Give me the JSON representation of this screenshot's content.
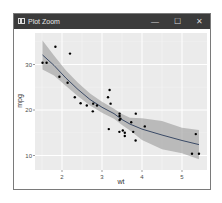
{
  "window": {
    "title": "Plot Zoom",
    "controls": {
      "minimize": "—",
      "maximize": "☐",
      "close": "✕"
    }
  },
  "colors": {
    "titlebar": "#3b3b3b",
    "panel": "#ebebeb",
    "grid": "#ffffff",
    "band": "#999999",
    "line": "#3a4a66",
    "point": "#000000"
  },
  "chart_data": {
    "type": "scatter",
    "title": "",
    "xlabel": "wt",
    "ylabel": "mpg",
    "xlim": [
      1.4,
      5.5
    ],
    "ylim": [
      9.5,
      35.5
    ],
    "x_ticks": [
      2,
      3,
      4,
      5
    ],
    "y_ticks": [
      10,
      20,
      30
    ],
    "grid": true,
    "smooth": "loess with confidence band",
    "points": [
      [
        2.62,
        21.0
      ],
      [
        2.875,
        21.0
      ],
      [
        2.32,
        22.8
      ],
      [
        3.215,
        21.4
      ],
      [
        3.44,
        18.7
      ],
      [
        3.46,
        18.1
      ],
      [
        3.57,
        14.3
      ],
      [
        3.19,
        24.4
      ],
      [
        3.15,
        22.8
      ],
      [
        3.44,
        19.2
      ],
      [
        3.44,
        17.8
      ],
      [
        4.07,
        16.4
      ],
      [
        3.73,
        17.3
      ],
      [
        3.78,
        15.2
      ],
      [
        5.25,
        10.4
      ],
      [
        5.424,
        10.4
      ],
      [
        5.345,
        14.7
      ],
      [
        2.2,
        32.4
      ],
      [
        1.615,
        30.4
      ],
      [
        1.835,
        33.9
      ],
      [
        2.465,
        21.5
      ],
      [
        3.52,
        15.5
      ],
      [
        3.435,
        15.2
      ],
      [
        3.84,
        13.3
      ],
      [
        3.845,
        19.2
      ],
      [
        1.935,
        27.3
      ],
      [
        2.14,
        26.0
      ],
      [
        1.513,
        30.4
      ],
      [
        3.17,
        15.8
      ],
      [
        2.77,
        19.7
      ],
      [
        3.57,
        15.0
      ],
      [
        2.78,
        21.4
      ]
    ],
    "smooth_line": [
      [
        1.513,
        32.1
      ],
      [
        1.8,
        29.8
      ],
      [
        2.1,
        27.0
      ],
      [
        2.4,
        24.5
      ],
      [
        2.7,
        22.3
      ],
      [
        3.0,
        20.6
      ],
      [
        3.3,
        19.2
      ],
      [
        3.5,
        17.9
      ],
      [
        3.7,
        16.9
      ],
      [
        4.0,
        15.8
      ],
      [
        4.5,
        14.5
      ],
      [
        5.0,
        13.3
      ],
      [
        5.424,
        12.4
      ]
    ],
    "band_upper": [
      [
        1.513,
        35.3
      ],
      [
        1.8,
        32.0
      ],
      [
        2.1,
        28.7
      ],
      [
        2.4,
        26.0
      ],
      [
        2.7,
        23.6
      ],
      [
        3.0,
        21.8
      ],
      [
        3.3,
        20.3
      ],
      [
        3.5,
        19.1
      ],
      [
        3.7,
        18.3
      ],
      [
        4.0,
        18.2
      ],
      [
        4.5,
        17.6
      ],
      [
        5.0,
        16.1
      ],
      [
        5.424,
        15.6
      ]
    ],
    "band_lower": [
      [
        1.513,
        28.9
      ],
      [
        1.8,
        27.6
      ],
      [
        2.1,
        25.3
      ],
      [
        2.4,
        23.0
      ],
      [
        2.7,
        21.0
      ],
      [
        3.0,
        19.4
      ],
      [
        3.3,
        18.1
      ],
      [
        3.5,
        16.7
      ],
      [
        3.7,
        15.5
      ],
      [
        4.0,
        13.4
      ],
      [
        4.5,
        11.4
      ],
      [
        5.0,
        10.5
      ],
      [
        5.424,
        9.2
      ]
    ]
  }
}
